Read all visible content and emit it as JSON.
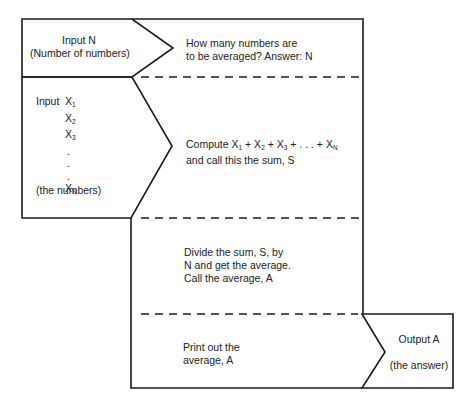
{
  "diagram": {
    "type": "flowchart",
    "title": "",
    "colors": {
      "line": "#1a1a1a",
      "background": "#ffffff",
      "text": "#222222"
    },
    "input_n": {
      "line1": "Input N",
      "line2": "(Number of numbers)"
    },
    "step1": {
      "line1": "How many numbers are",
      "line2": "to be averaged? Answer: N"
    },
    "input_x": {
      "prefix": "Input",
      "items": [
        "X",
        "X",
        "X",
        ".",
        ".",
        ".",
        "X"
      ],
      "subscripts": [
        "1",
        "2",
        "3",
        "",
        "",
        "",
        "N"
      ],
      "caption": "(the numbers)"
    },
    "step2": {
      "line1_parts": [
        "Compute X",
        "1",
        " + X",
        "2",
        " + X",
        "3",
        " + . . . + X",
        "N"
      ],
      "line2": "and call this the sum, S"
    },
    "step3": {
      "line1": "Divide the sum, S, by",
      "line2": "N and get the average.",
      "line3": "Call the average, A"
    },
    "step4": {
      "line1": "Print out the",
      "line2": "average, A"
    },
    "output": {
      "line1": "Output A",
      "line2": "(the answer)"
    }
  }
}
